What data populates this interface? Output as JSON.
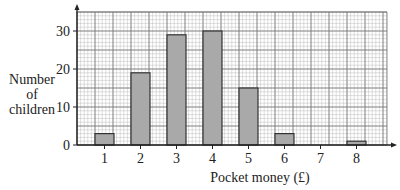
{
  "chart_data": {
    "type": "bar",
    "title": "",
    "xlabel": "Pocket money (£)",
    "ylabel": "Number of children",
    "ylabel_lines": [
      "Number",
      "of",
      "children"
    ],
    "categories": [
      "1",
      "2",
      "3",
      "4",
      "5",
      "6",
      "7",
      "8"
    ],
    "values": [
      3,
      19,
      29,
      30,
      15,
      3,
      0,
      1
    ],
    "ylim": [
      0,
      35
    ],
    "yticks": [
      "0",
      "10",
      "20",
      "30"
    ],
    "grid": true,
    "legend": null
  },
  "colors": {
    "bar_fill": "#a9a9a9",
    "bar_stroke": "#333333",
    "grid_major": "#777777",
    "grid_minor": "#bdbdbd",
    "axis": "#222222"
  }
}
